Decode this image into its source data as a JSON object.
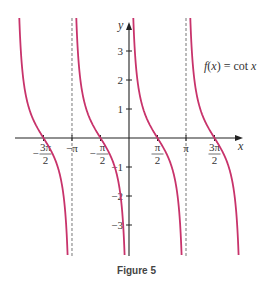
{
  "chart_data": {
    "type": "line",
    "title": "",
    "function_label": "f(x) = cot x",
    "xlabel": "x",
    "ylabel": "y",
    "xlim": [
      -6.28,
      6.28
    ],
    "ylim": [
      -4,
      4
    ],
    "grid": false,
    "x_ticks": [
      {
        "value": -4.712,
        "label_num": "3π",
        "label_den": "2",
        "sign": "−"
      },
      {
        "value": -3.1416,
        "label": "−π"
      },
      {
        "value": -1.5708,
        "label_num": "π",
        "label_den": "2",
        "sign": "−"
      },
      {
        "value": 1.5708,
        "label_num": "π",
        "label_den": "2",
        "sign": ""
      },
      {
        "value": 3.1416,
        "label": "π"
      },
      {
        "value": 4.712,
        "label_num": "3π",
        "label_den": "2",
        "sign": ""
      }
    ],
    "y_ticks": [
      3,
      2,
      1,
      -1,
      -2,
      -3
    ],
    "asymptotes": [
      -3.1416,
      3.1416
    ],
    "series": [
      {
        "name": "cot x, (-2π, -π)",
        "x_range": [
          -6.283,
          -3.1416
        ]
      },
      {
        "name": "cot x, (-π, 0)",
        "x_range": [
          -3.1416,
          0
        ]
      },
      {
        "name": "cot x, (0, π)",
        "x_range": [
          0,
          3.1416
        ]
      },
      {
        "name": "cot x, (π, 2π)",
        "x_range": [
          3.1416,
          6.283
        ]
      }
    ],
    "zeros": [
      -4.712,
      -1.5708,
      1.5708,
      4.712
    ],
    "curve_color": "#c8336b"
  },
  "caption": "Figure 5"
}
